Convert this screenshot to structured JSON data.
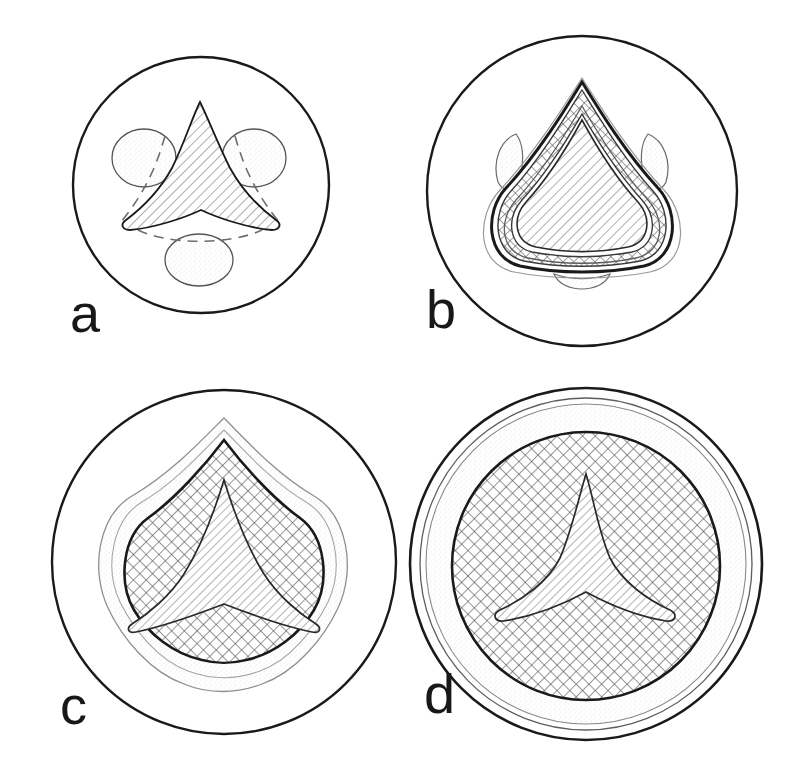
{
  "figure": {
    "background_color": "#ffffff",
    "ink_color": "#1a1a1a",
    "stipple_color": "#efefef",
    "hatch_color": "#6e6e6e",
    "panel_count": 4,
    "layout": "2x2 grid"
  },
  "panels": [
    {
      "id": "a",
      "label": "a",
      "stage": 1,
      "outer_circle": {
        "cx": 143,
        "cy": 145,
        "r": 128
      },
      "features": [
        "outer circular boundary",
        "central triradiate hatched core",
        "three stippled oval bodies (left, right, bottom)",
        "dashed arc outlines around the core"
      ],
      "oval_count": 3,
      "fill_styles": [
        "diagonal-hatch",
        "stipple"
      ]
    },
    {
      "id": "b",
      "label": "b",
      "stage": 2,
      "outer_circle": {
        "cx": 178,
        "cy": 160,
        "r": 155
      },
      "features": [
        "outer circular boundary",
        "large triangular core with diagonal hatching",
        "cross-hatched marginal band",
        "two small lateral stippled lobes",
        "small crescent stippled lobe at bottom"
      ],
      "oval_count": 3,
      "fill_styles": [
        "diagonal-hatch",
        "cross-hatch",
        "stipple"
      ]
    },
    {
      "id": "c",
      "label": "c",
      "stage": 3,
      "outer_circle": {
        "cx": 182,
        "cy": 172,
        "r": 170
      },
      "features": [
        "outer circular boundary",
        "rounded-triangular cross-hatched mass",
        "inner triradiate diagonally hatched core",
        "thin stippled envelope around the mass"
      ],
      "oval_count": 0,
      "fill_styles": [
        "cross-hatch",
        "diagonal-hatch",
        "stipple"
      ]
    },
    {
      "id": "d",
      "label": "d",
      "stage": 4,
      "outer_circle": {
        "cx": 186,
        "cy": 178,
        "r": 176
      },
      "features": [
        "outer circular boundary",
        "thin concentric inner circle",
        "stippled annular ring",
        "large cross-hatched disc",
        "small triradiate diagonally hatched center"
      ],
      "oval_count": 0,
      "fill_styles": [
        "cross-hatch",
        "diagonal-hatch",
        "stipple"
      ]
    }
  ],
  "legend_keys": {
    "diagonal_hatch": "core tissue",
    "cross_hatch": "surrounding expanded tissue",
    "stipple": "adjacent bodies / envelope"
  }
}
